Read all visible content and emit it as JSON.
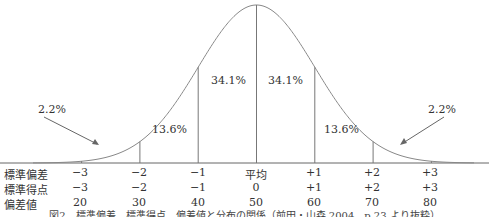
{
  "chart_data": {
    "type": "area",
    "title": "標準偏差、標準得点、偏差値と分布の関係",
    "regions": [
      {
        "from": "-inf",
        "to": -2,
        "label": "2.2%"
      },
      {
        "from": -2,
        "to": -1,
        "label": "13.6%"
      },
      {
        "from": -1,
        "to": 0,
        "label": "34.1%"
      },
      {
        "from": 0,
        "to": 1,
        "label": "34.1%"
      },
      {
        "from": 1,
        "to": 2,
        "label": "13.6%"
      },
      {
        "from": 2,
        "to": "inf",
        "label": "2.2%"
      }
    ],
    "x_ticks": [
      -3,
      -2,
      -1,
      0,
      1,
      2,
      3
    ],
    "rows": [
      {
        "name": "標準偏差",
        "values": [
          "−3",
          "−2",
          "−1",
          "平均",
          "+1",
          "+2",
          "+3"
        ]
      },
      {
        "name": "標準得点",
        "values": [
          "−3",
          "−2",
          "−1",
          "0",
          "+1",
          "+2",
          "+3"
        ]
      },
      {
        "name": "偏差値",
        "values": [
          "20",
          "30",
          "40",
          "50",
          "60",
          "70",
          "80"
        ]
      }
    ],
    "grid": false,
    "legend": "none"
  },
  "labels": {
    "tail_left": "2.2%",
    "tail_right": "2.2%",
    "band_m2_m1": "13.6%",
    "band_m1_0": "34.1%",
    "band_0_p1": "34.1%",
    "band_p1_p2": "13.6%"
  },
  "table": {
    "row_labels": [
      "標準偏差",
      "標準得点",
      "偏差値"
    ],
    "sd": [
      "−3",
      "−2",
      "−1",
      "平均",
      "+1",
      "+2",
      "+3"
    ],
    "z": [
      "−3",
      "−2",
      "−1",
      "0",
      "+1",
      "+2",
      "+3"
    ],
    "t": [
      "20",
      "30",
      "40",
      "50",
      "60",
      "70",
      "80"
    ]
  },
  "caption": "図2　標準偏差、標準得点、偏差値と分布の関係（前田・山森 2004、p.23 より抜粋）"
}
